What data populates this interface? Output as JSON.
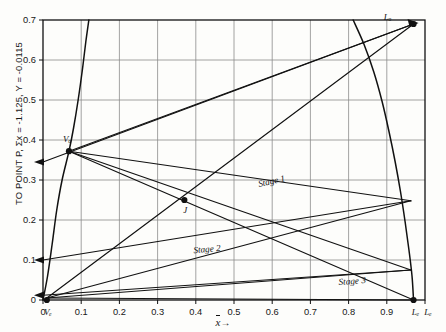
{
  "figure": {
    "ylabel": "TO POINT P, Σx = -1.125, Y = -0.0115",
    "xlabel": "x",
    "xlabel_arrow": "→"
  },
  "chart_data": {
    "type": "line",
    "title": "",
    "xlabel": "x",
    "ylabel": "TO POINT P, Σx = -1.125, Y = -0.0115",
    "xlim": [
      0,
      1.0
    ],
    "ylim": [
      0,
      0.7
    ],
    "grid": true,
    "legend": "none",
    "xticks": [
      0,
      0.1,
      0.2,
      0.3,
      0.4,
      0.5,
      0.6,
      0.7,
      0.8,
      0.9,
      1.0
    ],
    "xticklabels": [
      "0",
      "0.1",
      "0.2",
      "0.3",
      "0.4",
      "0.5",
      "0.6",
      "0.7",
      "0.8",
      "0.9",
      "1.0"
    ],
    "yticks": [
      0,
      0.1,
      0.2,
      0.3,
      0.4,
      0.5,
      0.6,
      0.7
    ],
    "yticklabels": [
      "0",
      "0.1",
      "0.2",
      "0.3",
      "0.4",
      "0.5",
      "0.6",
      "0.7"
    ],
    "series": [
      {
        "name": "binodal-curve",
        "type": "line",
        "points": [
          [
            0.0,
            0.0
          ],
          [
            0.012,
            0.06
          ],
          [
            0.024,
            0.14
          ],
          [
            0.036,
            0.225
          ],
          [
            0.05,
            0.3
          ],
          [
            0.068,
            0.372
          ],
          [
            0.08,
            0.43
          ],
          [
            0.092,
            0.5
          ],
          [
            0.103,
            0.575
          ],
          [
            0.112,
            0.645
          ],
          [
            0.12,
            0.7
          ]
        ]
      },
      {
        "name": "binodal-curve-right",
        "type": "line",
        "points": [
          [
            0.812,
            0.7
          ],
          [
            0.84,
            0.64
          ],
          [
            0.866,
            0.57
          ],
          [
            0.888,
            0.495
          ],
          [
            0.906,
            0.42
          ],
          [
            0.922,
            0.345
          ],
          [
            0.936,
            0.27
          ],
          [
            0.948,
            0.195
          ],
          [
            0.958,
            0.125
          ],
          [
            0.966,
            0.06
          ],
          [
            0.97,
            0.0
          ]
        ]
      },
      {
        "name": "operating-line-Vb-to-Lo",
        "type": "line",
        "points": [
          [
            0.068,
            0.372
          ],
          [
            0.97,
            0.69
          ]
        ]
      },
      {
        "name": "operating-line-Vb-to-right-025",
        "type": "line",
        "points": [
          [
            0.068,
            0.372
          ],
          [
            0.963,
            0.248
          ]
        ]
      },
      {
        "name": "operating-line-Vb-to-right-007",
        "type": "line",
        "points": [
          [
            0.068,
            0.372
          ],
          [
            0.963,
            0.075
          ]
        ]
      },
      {
        "name": "operating-line-Vb-to-Lb",
        "type": "line",
        "points": [
          [
            0.068,
            0.372
          ],
          [
            0.97,
            0.0
          ]
        ]
      },
      {
        "name": "tieline-origin-to-Lo",
        "type": "line",
        "points": [
          [
            0.01,
            0.005
          ],
          [
            0.97,
            0.69
          ]
        ]
      },
      {
        "name": "tieline-origin-to-right-025",
        "type": "line",
        "points": [
          [
            0.01,
            0.005
          ],
          [
            0.963,
            0.248
          ]
        ]
      },
      {
        "name": "tieline-origin-to-right-007",
        "type": "line",
        "points": [
          [
            0.01,
            0.005
          ],
          [
            0.963,
            0.075
          ]
        ]
      },
      {
        "name": "tieline-origin-to-Lb",
        "type": "line",
        "points": [
          [
            0.01,
            0.005
          ],
          [
            0.97,
            0.0
          ]
        ]
      },
      {
        "name": "arrow-line-to-P-upper",
        "type": "line",
        "points": [
          [
            0.97,
            0.69
          ],
          [
            0.0,
            0.345
          ]
        ]
      },
      {
        "name": "arrow-line-to-P-lower",
        "type": "line",
        "points": [
          [
            0.963,
            0.248
          ],
          [
            0.0,
            0.1
          ]
        ]
      },
      {
        "name": "arrow-line-to-P-bottom",
        "type": "line",
        "points": [
          [
            0.963,
            0.075
          ],
          [
            0.0,
            0.012
          ]
        ]
      }
    ],
    "annotations": [
      {
        "name": "point-Vb",
        "label": "Vₒ",
        "x": 0.068,
        "y": 0.372,
        "marker": true
      },
      {
        "name": "point-J",
        "label": "J",
        "x": 0.37,
        "y": 0.25,
        "marker": true
      },
      {
        "name": "point-Lo",
        "label": "Lₒ",
        "x": 0.97,
        "y": 0.69,
        "marker": true
      },
      {
        "name": "point-Lb",
        "label": "Lₑ",
        "x": 0.97,
        "y": 0.0,
        "marker": true
      },
      {
        "name": "point-origin-Vb",
        "label": "Vₑ",
        "x": 0.01,
        "y": 0.0,
        "marker": true
      },
      {
        "name": "stage-1",
        "label": "Stage 1",
        "x": 0.6,
        "y": 0.29,
        "marker": false
      },
      {
        "name": "stage-2",
        "label": "Stage 2",
        "x": 0.43,
        "y": 0.12,
        "marker": false
      },
      {
        "name": "stage-3",
        "label": "Stage 3",
        "x": 0.81,
        "y": 0.04,
        "marker": false
      }
    ]
  }
}
